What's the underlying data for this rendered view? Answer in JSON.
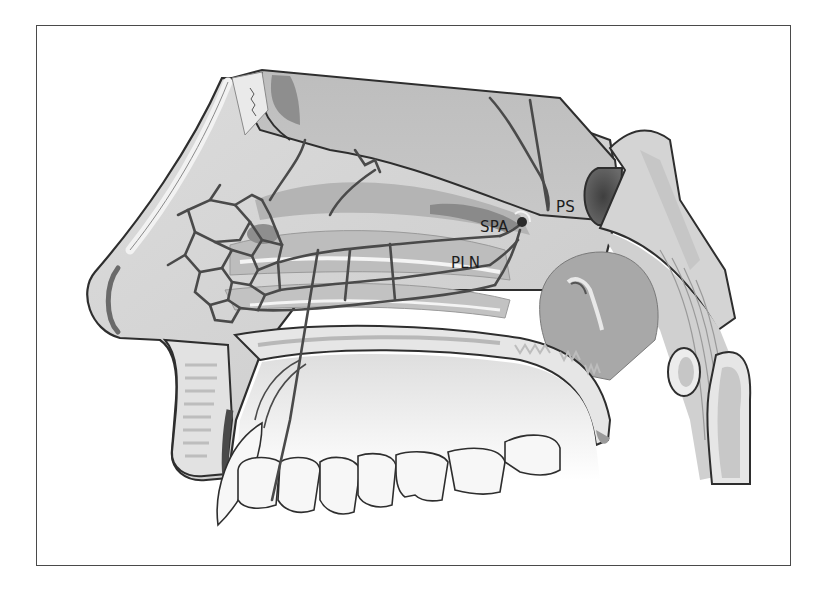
{
  "figure": {
    "labels": [
      {
        "id": "ps",
        "text": "PS",
        "x": 556,
        "y": 200
      },
      {
        "id": "spa",
        "text": "SPA",
        "x": 480,
        "y": 220
      },
      {
        "id": "pln",
        "text": "PLN",
        "x": 451,
        "y": 256
      }
    ]
  },
  "colors": {
    "frame": "#4a4a4a",
    "outline": "#2e2e2e",
    "vessel": "#4a4a4a",
    "bone_light": "#e6e6e6",
    "tissue_mid": "#c4c4c4",
    "tissue_dark": "#9a9a9a",
    "cavity_dark": "#5a5a5a",
    "teeth": "#f7f7f7"
  }
}
